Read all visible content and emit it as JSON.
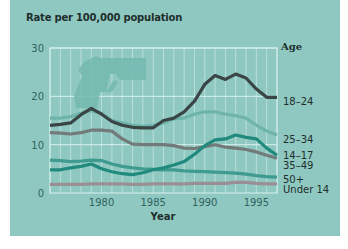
{
  "chart_data": {
    "type": "line",
    "title": "Rate per 100,000 population",
    "xlabel": "Year",
    "ylabel": "Rate per 100,000 population",
    "legend_title": "Age",
    "xlim": [
      1975,
      1997
    ],
    "ylim": [
      0,
      30
    ],
    "x_ticks": [
      1980,
      1985,
      1990,
      1995
    ],
    "y_ticks": [
      0,
      10,
      20,
      30
    ],
    "grid": {
      "vertical_every_year": true,
      "horizontal": [
        10,
        20,
        30
      ]
    },
    "legend_position": "right, labels at line ends",
    "decoration": "handgun silhouette watermark in upper left of plot",
    "x": [
      1975,
      1976,
      1977,
      1978,
      1979,
      1980,
      1981,
      1982,
      1983,
      1984,
      1985,
      1986,
      1987,
      1988,
      1989,
      1990,
      1991,
      1992,
      1993,
      1994,
      1995,
      1996,
      1997
    ],
    "series": [
      {
        "name": "18–24",
        "color": "#3a4645",
        "values": [
          14,
          14.2,
          14.5,
          16.2,
          17.5,
          16.3,
          14.8,
          14,
          13.6,
          13.5,
          13.5,
          15,
          15.5,
          16.8,
          19,
          22.5,
          24.3,
          23.5,
          24.6,
          23.8,
          21.5,
          19.8,
          19.8
        ]
      },
      {
        "name": "25–34",
        "color": "#6fb4ac",
        "values": [
          15.5,
          15.5,
          15.8,
          16.5,
          17,
          16.5,
          15,
          14.5,
          14,
          13.8,
          14,
          14.5,
          15.3,
          15.5,
          16.3,
          16.8,
          16.8,
          16.3,
          16,
          15.5,
          14,
          12.8,
          12
        ]
      },
      {
        "name": "14–17",
        "color": "#1f8a7d",
        "values": [
          4.8,
          4.8,
          5.2,
          5.5,
          6,
          5,
          4.4,
          4,
          3.8,
          4.2,
          4.8,
          5.2,
          5.8,
          6.5,
          8,
          9.8,
          11,
          11.2,
          12,
          11.5,
          11.2,
          9.3,
          7.8
        ]
      },
      {
        "name": "35–49",
        "color": "#737a7a",
        "values": [
          12.5,
          12.4,
          12.2,
          12.5,
          13,
          13,
          12.8,
          11.2,
          10.1,
          10,
          10,
          10,
          9.8,
          9.3,
          9.2,
          9.6,
          10,
          9.5,
          9.3,
          9,
          8.5,
          7.8,
          7.2
        ]
      },
      {
        "name": "50+",
        "color": "#3f9b90",
        "values": [
          6.8,
          6.7,
          6.5,
          6.6,
          6.8,
          6.7,
          6,
          5.5,
          5.2,
          5,
          4.9,
          4.8,
          4.8,
          4.6,
          4.5,
          4.4,
          4.3,
          4.2,
          4.1,
          3.9,
          3.6,
          3.4,
          3.3
        ]
      },
      {
        "name": "Under 14",
        "color": "#9a8f95",
        "values": [
          1.8,
          1.8,
          1.8,
          1.8,
          1.9,
          1.9,
          1.9,
          1.9,
          1.8,
          1.8,
          1.9,
          1.9,
          1.9,
          1.9,
          2,
          2,
          2,
          2,
          2.2,
          2.2,
          2,
          1.9,
          1.9
        ]
      }
    ]
  },
  "labels": {
    "title": "Rate per 100,000 population",
    "age": "Age",
    "year": "Year",
    "y_ticks": [
      "30",
      "20",
      "10",
      "0"
    ],
    "x_ticks": [
      "1980",
      "1985",
      "1990",
      "1995"
    ],
    "series": [
      "18–24",
      "25–34",
      "14–17",
      "35–49",
      "50+",
      "Under 14"
    ]
  },
  "colors": {
    "panel_bg": "#8fc8c0",
    "grid": "#d8f0ec",
    "gun": "#73b8ae"
  }
}
